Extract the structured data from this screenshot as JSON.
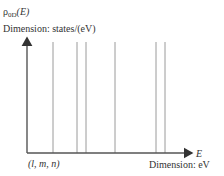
{
  "diagram": {
    "y_axis": {
      "symbol": "ρ",
      "subscript": "0D",
      "argument": "(E)",
      "dimension_label": "Dimension: states/(eV)"
    },
    "x_axis": {
      "symbol": "E",
      "dimension_label": "Dimension: eV",
      "origin_label": "(l, m, n)"
    },
    "delta_lines_x_px": [
      53,
      77,
      86,
      115,
      156,
      165
    ],
    "colors": {
      "axis": "#555555",
      "lines": "#9a9a9a",
      "text": "#333333"
    }
  },
  "chart_data": {
    "type": "line",
    "title": "ρ0D(E)",
    "xlabel": "E (Dimension: eV)",
    "ylabel": "ρ0D(E) (Dimension: states/(eV))",
    "x_relative_positions": [
      0.16,
      0.3,
      0.36,
      0.53,
      0.78,
      0.83
    ],
    "values": [
      1,
      1,
      1,
      1,
      1,
      1
    ],
    "grid": false
  }
}
